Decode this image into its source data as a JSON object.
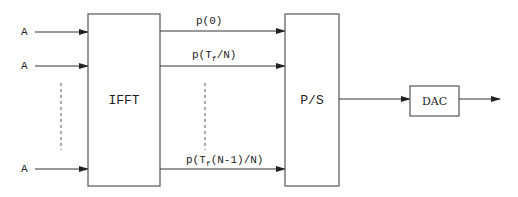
{
  "diagram": {
    "title": "",
    "inputs": [
      {
        "label": "A"
      },
      {
        "label": "A"
      },
      {
        "label": "A"
      }
    ],
    "blocks": {
      "ifft": {
        "label": "IFFT"
      },
      "ps": {
        "label": "P/S"
      },
      "dac": {
        "label": "DAC"
      }
    },
    "outputs": [
      {
        "label": "p(0)",
        "main": "p(0)",
        "sub": "",
        "tail": ""
      },
      {
        "label": "p(T_f/N)",
        "main": "p(T",
        "sub": "f",
        "tail": "/N)"
      },
      {
        "label": "p(T_f(N-1)/N)",
        "main": "p(T",
        "sub": "f",
        "tail": "(N-1)/N)"
      }
    ],
    "colors": {
      "stroke": "#555555",
      "text": "#222222",
      "background": "#ffffff"
    }
  }
}
